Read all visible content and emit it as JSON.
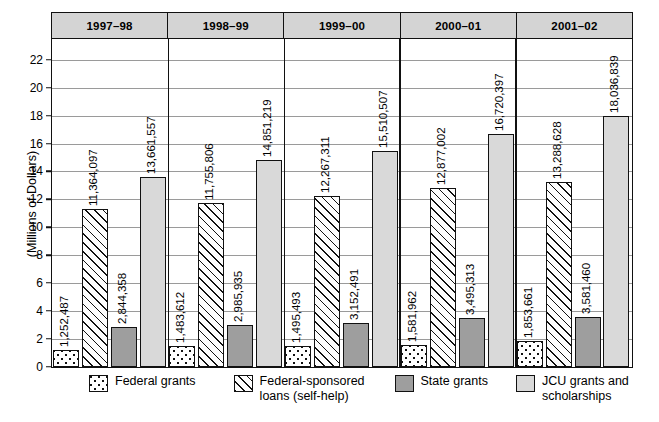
{
  "chart_data": {
    "type": "bar",
    "title": "",
    "xlabel": "",
    "ylabel": "(Millions of Dollars)",
    "ylim": [
      0,
      23.5
    ],
    "yticks": [
      0,
      2,
      4,
      6,
      8,
      10,
      12,
      14,
      16,
      18,
      20,
      22
    ],
    "ytick_labels": [
      "0",
      "2",
      "4",
      "6",
      "8",
      "10",
      "12",
      "14",
      "16",
      "18",
      "20",
      "22"
    ],
    "grid": true,
    "legend_position": "bottom",
    "units": "dollars",
    "categories": [
      "1997–98",
      "1998–99",
      "1999–00",
      "2000–01",
      "2001–02"
    ],
    "series": [
      {
        "name": "Federal grants",
        "pattern": "dotted",
        "color": "#ffffff",
        "values": [
          1252487,
          1483612,
          1495493,
          1581962,
          1853661
        ],
        "labels": [
          "1,252,487",
          "1,483,612",
          "1,495,493",
          "1,581,962",
          "1,853,661"
        ]
      },
      {
        "name": "Federal-sponsored loans (self-help)",
        "pattern": "diagonal-hatch",
        "color": "#fdfdfd",
        "values": [
          11364097,
          11755806,
          12267311,
          12877002,
          13288628
        ],
        "labels": [
          "11,364,097",
          "11,755,806",
          "12,267,311",
          "12,877,002",
          "13,288,628"
        ]
      },
      {
        "name": "State grants",
        "pattern": "solid",
        "color": "#9e9e9e",
        "values": [
          2844358,
          2985935,
          3152491,
          3495313,
          3581460
        ],
        "labels": [
          "2,844,358",
          "2,985,935",
          "3,152,491",
          "3,495,313",
          "3,581,460"
        ]
      },
      {
        "name": "JCU grants and scholarships",
        "pattern": "solid",
        "color": "#d9d9d9",
        "values": [
          13661557,
          14851219,
          15510507,
          16720397,
          18036839
        ],
        "labels": [
          "13,661,557",
          "14,851,219",
          "15,510,507",
          "16,720,397",
          "18,036,839"
        ]
      }
    ]
  },
  "legend": [
    {
      "label": "Federal grants"
    },
    {
      "label": "Federal-sponsored\nloans (self-help)"
    },
    {
      "label": "State grants"
    },
    {
      "label": "JCU grants and\nscholarships"
    }
  ]
}
